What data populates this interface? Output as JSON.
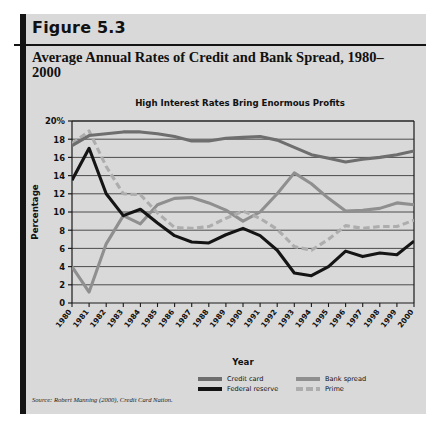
{
  "figure": {
    "label": "Figure 5.3",
    "title": "Average Annual Rates of Credit and Bank Spread, 1980–2000",
    "source_prefix": "Source: Robert Manning (2000),",
    "source_book": "Credit Card Nation."
  },
  "colors": {
    "card_background": "#d9d9d9",
    "rule": "#141414",
    "credit_card": "#6e6e6e",
    "federal_reserve": "#141414",
    "bank_spread": "#8f8f8f",
    "prime": "#adadad",
    "axis": "#1a1a1a",
    "gridline": "#3c3c3c"
  },
  "chart_data": {
    "type": "line",
    "title": "High Interest Rates Bring Enormous Profits",
    "xlabel": "Year",
    "ylabel": "Percentage",
    "ylim": [
      0,
      20
    ],
    "yticks": [
      0,
      2,
      4,
      6,
      8,
      10,
      12,
      14,
      16,
      18,
      20
    ],
    "ytick_labels": [
      "0",
      "2",
      "4",
      "6",
      "8",
      "10",
      "12",
      "14",
      "16",
      "18",
      "20%"
    ],
    "grid": true,
    "legend_position": "bottom",
    "categories": [
      "1980",
      "1981",
      "1982",
      "1983",
      "1984",
      "1985",
      "1986",
      "1987",
      "1988",
      "1989",
      "1990",
      "1991",
      "1992",
      "1993",
      "1994",
      "1995",
      "1996",
      "1997",
      "1998",
      "1999",
      "2000"
    ],
    "series": [
      {
        "name": "Credit card",
        "color": "#6e6e6e",
        "style": "solid",
        "values": [
          17.3,
          18.4,
          18.6,
          18.8,
          18.8,
          18.6,
          18.3,
          17.8,
          17.8,
          18.1,
          18.2,
          18.3,
          17.9,
          17.1,
          16.3,
          15.9,
          15.5,
          15.8,
          16.0,
          16.3,
          16.7
        ]
      },
      {
        "name": "Bank spread",
        "color": "#8f8f8f",
        "style": "solid",
        "values": [
          4.0,
          1.2,
          6.5,
          9.6,
          8.7,
          10.8,
          11.5,
          11.6,
          11.0,
          10.2,
          9.0,
          10.0,
          12.0,
          14.3,
          13.1,
          11.5,
          10.1,
          10.2,
          10.4,
          11.0,
          10.8
        ]
      },
      {
        "name": "Federal reserve",
        "color": "#141414",
        "style": "solid",
        "values": [
          13.5,
          17.0,
          12.0,
          9.6,
          10.3,
          8.8,
          7.4,
          6.7,
          6.6,
          7.5,
          8.2,
          7.4,
          5.8,
          3.3,
          3.0,
          4.0,
          5.7,
          5.1,
          5.5,
          5.3,
          6.8
        ]
      },
      {
        "name": "Prime",
        "color": "#adadad",
        "style": "dashed",
        "values": [
          17.5,
          18.9,
          15.0,
          12.0,
          11.9,
          9.9,
          8.3,
          8.2,
          8.4,
          9.3,
          10.1,
          9.3,
          8.1,
          6.2,
          5.8,
          7.0,
          8.5,
          8.2,
          8.4,
          8.4,
          9.1
        ]
      }
    ]
  },
  "legend": {
    "rows": [
      [
        {
          "name": "Credit card",
          "key": "credit_card"
        },
        {
          "name": "Bank spread",
          "key": "bank_spread"
        }
      ],
      [
        {
          "name": "Federal reserve",
          "key": "federal_reserve"
        },
        {
          "name": "Prime",
          "key": "prime"
        }
      ]
    ]
  }
}
